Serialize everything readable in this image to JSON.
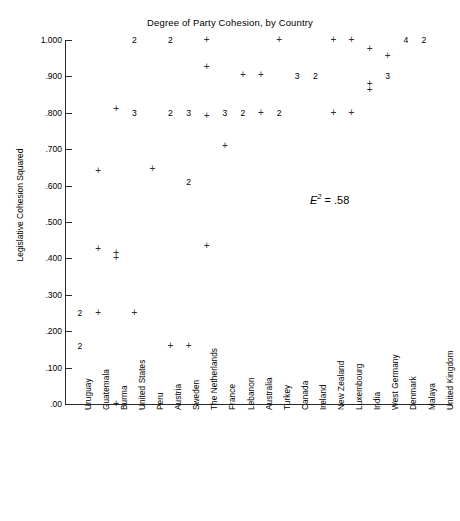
{
  "chart_data": {
    "type": "scatter",
    "title": "Degree of Party Cohesion, by Country",
    "xlabel": "",
    "ylabel": "Legislative Cohesion Squared",
    "ylim": [
      0.0,
      1.0
    ],
    "grid": false,
    "legend": null,
    "annotations": [
      {
        "text_symbol": "E",
        "text_exponent": "2",
        "text_equals": " = ",
        "text_value": ".58",
        "full_text": "E2 = .58",
        "x_px": 310,
        "y_px": 192
      }
    ],
    "ytick_labels": [
      "1.000",
      ".900",
      ".800",
      ".700",
      ".600",
      ".500",
      ".400",
      ".300",
      ".200",
      ".100",
      ".00"
    ],
    "ytick_values": [
      1.0,
      0.9,
      0.8,
      0.7,
      0.6,
      0.5,
      0.4,
      0.3,
      0.2,
      0.1,
      0.0
    ],
    "categories": [
      "Uruguay",
      "Guatemala",
      "Burma",
      "United States",
      "Peru",
      "Austria",
      "Sweden",
      "The Netherlands",
      "France",
      "Lebanon",
      "Australia",
      "Turkey",
      "Canada",
      "Ireland",
      "New Zealand",
      "Luxembourg",
      "India",
      "West Germany",
      "Denmark",
      "Malaya",
      "United Kingdom"
    ],
    "marker_note": "'+' denotes a single observation; a digit denotes that many coincident observations at that point.",
    "points": [
      {
        "country": "Uruguay",
        "x_index": 0,
        "y": 0.25,
        "label": "2",
        "count": 2
      },
      {
        "country": "Uruguay",
        "x_index": 0,
        "y": 0.16,
        "label": "2",
        "count": 2
      },
      {
        "country": "Guatemala",
        "x_index": 1,
        "y": 0.64,
        "label": "+",
        "count": 1
      },
      {
        "country": "Guatemala",
        "x_index": 1,
        "y": 0.425,
        "label": "+",
        "count": 1
      },
      {
        "country": "Guatemala",
        "x_index": 1,
        "y": 0.25,
        "label": "+",
        "count": 1
      },
      {
        "country": "Burma",
        "x_index": 2,
        "y": 0.81,
        "label": "+",
        "count": 1
      },
      {
        "country": "Burma",
        "x_index": 2,
        "y": 0.415,
        "label": "+",
        "count": 1
      },
      {
        "country": "Burma",
        "x_index": 2,
        "y": 0.4,
        "label": "+",
        "count": 1
      },
      {
        "country": "Burma",
        "x_index": 2,
        "y": 0.0,
        "label": "+",
        "count": 1
      },
      {
        "country": "United States",
        "x_index": 3,
        "y": 1.0,
        "label": "2",
        "count": 2
      },
      {
        "country": "United States",
        "x_index": 3,
        "y": 0.8,
        "label": "3",
        "count": 3
      },
      {
        "country": "United States",
        "x_index": 3,
        "y": 0.25,
        "label": "+",
        "count": 1
      },
      {
        "country": "Peru",
        "x_index": 4,
        "y": 0.645,
        "label": "+",
        "count": 1
      },
      {
        "country": "Austria",
        "x_index": 5,
        "y": 1.0,
        "label": "2",
        "count": 2
      },
      {
        "country": "Austria",
        "x_index": 5,
        "y": 0.8,
        "label": "2",
        "count": 2
      },
      {
        "country": "Austria",
        "x_index": 5,
        "y": 0.16,
        "label": "+",
        "count": 1
      },
      {
        "country": "Sweden",
        "x_index": 6,
        "y": 0.8,
        "label": "3",
        "count": 3
      },
      {
        "country": "Sweden",
        "x_index": 6,
        "y": 0.61,
        "label": "2",
        "count": 2
      },
      {
        "country": "Sweden",
        "x_index": 6,
        "y": 0.16,
        "label": "+",
        "count": 1
      },
      {
        "country": "The Netherlands",
        "x_index": 7,
        "y": 1.0,
        "label": "+",
        "count": 1
      },
      {
        "country": "The Netherlands",
        "x_index": 7,
        "y": 0.925,
        "label": "+",
        "count": 1
      },
      {
        "country": "The Netherlands",
        "x_index": 7,
        "y": 0.79,
        "label": "+",
        "count": 1
      },
      {
        "country": "The Netherlands",
        "x_index": 7,
        "y": 0.435,
        "label": "+",
        "count": 1
      },
      {
        "country": "France",
        "x_index": 8,
        "y": 0.8,
        "label": "3",
        "count": 3
      },
      {
        "country": "France",
        "x_index": 8,
        "y": 0.71,
        "label": "+",
        "count": 1
      },
      {
        "country": "Lebanon",
        "x_index": 9,
        "y": 0.905,
        "label": "+",
        "count": 1
      },
      {
        "country": "Lebanon",
        "x_index": 9,
        "y": 0.8,
        "label": "2",
        "count": 2
      },
      {
        "country": "Australia",
        "x_index": 10,
        "y": 0.905,
        "label": "+",
        "count": 1
      },
      {
        "country": "Australia",
        "x_index": 10,
        "y": 0.8,
        "label": "+",
        "count": 1
      },
      {
        "country": "Turkey",
        "x_index": 11,
        "y": 1.0,
        "label": "+",
        "count": 1
      },
      {
        "country": "Turkey",
        "x_index": 11,
        "y": 0.8,
        "label": "2",
        "count": 2
      },
      {
        "country": "Canada",
        "x_index": 12,
        "y": 0.9,
        "label": "3",
        "count": 3
      },
      {
        "country": "Ireland",
        "x_index": 13,
        "y": 0.9,
        "label": "2",
        "count": 2
      },
      {
        "country": "New Zealand",
        "x_index": 14,
        "y": 1.0,
        "label": "+",
        "count": 1
      },
      {
        "country": "New Zealand",
        "x_index": 14,
        "y": 0.8,
        "label": "+",
        "count": 1
      },
      {
        "country": "Luxembourg",
        "x_index": 15,
        "y": 1.0,
        "label": "+",
        "count": 1
      },
      {
        "country": "Luxembourg",
        "x_index": 15,
        "y": 0.8,
        "label": "+",
        "count": 1
      },
      {
        "country": "India",
        "x_index": 16,
        "y": 0.975,
        "label": "+",
        "count": 1
      },
      {
        "country": "India",
        "x_index": 16,
        "y": 0.88,
        "label": "+",
        "count": 1
      },
      {
        "country": "India",
        "x_index": 16,
        "y": 0.862,
        "label": "+",
        "count": 1
      },
      {
        "country": "West Germany",
        "x_index": 17,
        "y": 0.955,
        "label": "+",
        "count": 1
      },
      {
        "country": "West Germany",
        "x_index": 17,
        "y": 0.9,
        "label": "3",
        "count": 3
      },
      {
        "country": "Denmark",
        "x_index": 18,
        "y": 1.0,
        "label": "4",
        "count": 4
      },
      {
        "country": "Malaya",
        "x_index": 19,
        "y": 1.0,
        "label": "2",
        "count": 2
      }
    ]
  }
}
